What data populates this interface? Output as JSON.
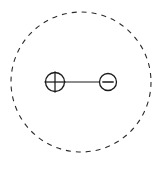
{
  "figure": {
    "background_color": "#ffffff",
    "stroke_color": "#1a1a1a",
    "width": 163,
    "height": 171
  },
  "gaussian_surface": {
    "label": "gaussian-surface",
    "shape": "circle",
    "style": "dashed",
    "center_x": 81,
    "center_y": 82,
    "radius": 70,
    "stroke_color": "#2b2b2b",
    "stroke_width": 1.1,
    "dash_length": 5,
    "dash_gap": 5
  },
  "dipole": {
    "label": "electric-dipole",
    "bond": {
      "label": "bond-line",
      "x1": 65,
      "x2": 99,
      "y": 82,
      "stroke_color": "#1a1a1a",
      "stroke_width": 1.2
    },
    "charges": [
      {
        "name": "positive-charge",
        "sign": "+",
        "center_x": 55,
        "center_y": 82,
        "radius": 9.5,
        "stroke_color": "#1a1a1a",
        "stroke_width": 1.3,
        "fill": "#ffffff"
      },
      {
        "name": "negative-charge",
        "sign": "−",
        "center_x": 108,
        "center_y": 82,
        "radius": 8.5,
        "stroke_color": "#1a1a1a",
        "stroke_width": 1.3,
        "fill": "#ffffff"
      }
    ]
  },
  "caption": {
    "text": ""
  }
}
